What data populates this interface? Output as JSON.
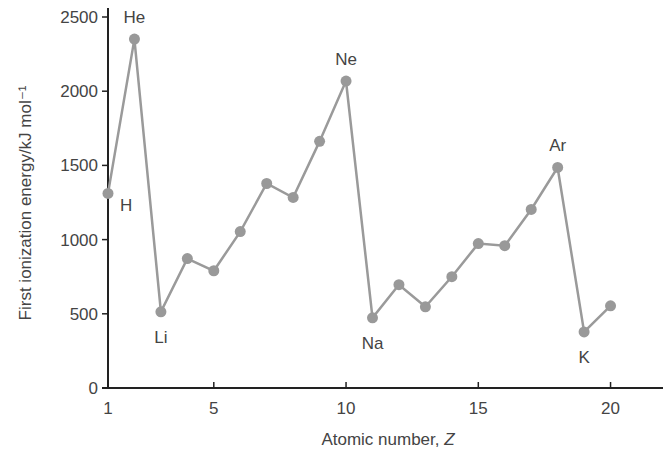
{
  "chart_data": {
    "type": "line",
    "title": "",
    "xlabel": "Atomic number, Z",
    "ylabel": "First ionization energy/kJ mol⁻¹",
    "xlim": [
      1,
      22
    ],
    "ylim": [
      0,
      2500
    ],
    "grid": false,
    "legend": null,
    "x_ticks": [
      1,
      5,
      10,
      15,
      20
    ],
    "y_ticks": [
      0,
      500,
      1000,
      1500,
      2000,
      2500
    ],
    "series": [
      {
        "name": "First ionization energy",
        "x": [
          1,
          2,
          3,
          4,
          5,
          6,
          7,
          8,
          9,
          10,
          11,
          12,
          13,
          14,
          15,
          16,
          17,
          18,
          19,
          20
        ],
        "values": [
          1311,
          2351,
          513,
          872,
          790,
          1054,
          1378,
          1284,
          1662,
          2068,
          473,
          696,
          547,
          750,
          973,
          959,
          1203,
          1486,
          378,
          554
        ]
      }
    ],
    "annotations": [
      {
        "text": "H",
        "x": 1,
        "position": "below-right"
      },
      {
        "text": "He",
        "x": 2,
        "position": "above"
      },
      {
        "text": "Li",
        "x": 3,
        "position": "below"
      },
      {
        "text": "Ne",
        "x": 10,
        "position": "above"
      },
      {
        "text": "Na",
        "x": 11,
        "position": "below"
      },
      {
        "text": "Ar",
        "x": 18,
        "position": "above"
      },
      {
        "text": "K",
        "x": 19,
        "position": "below"
      }
    ]
  }
}
